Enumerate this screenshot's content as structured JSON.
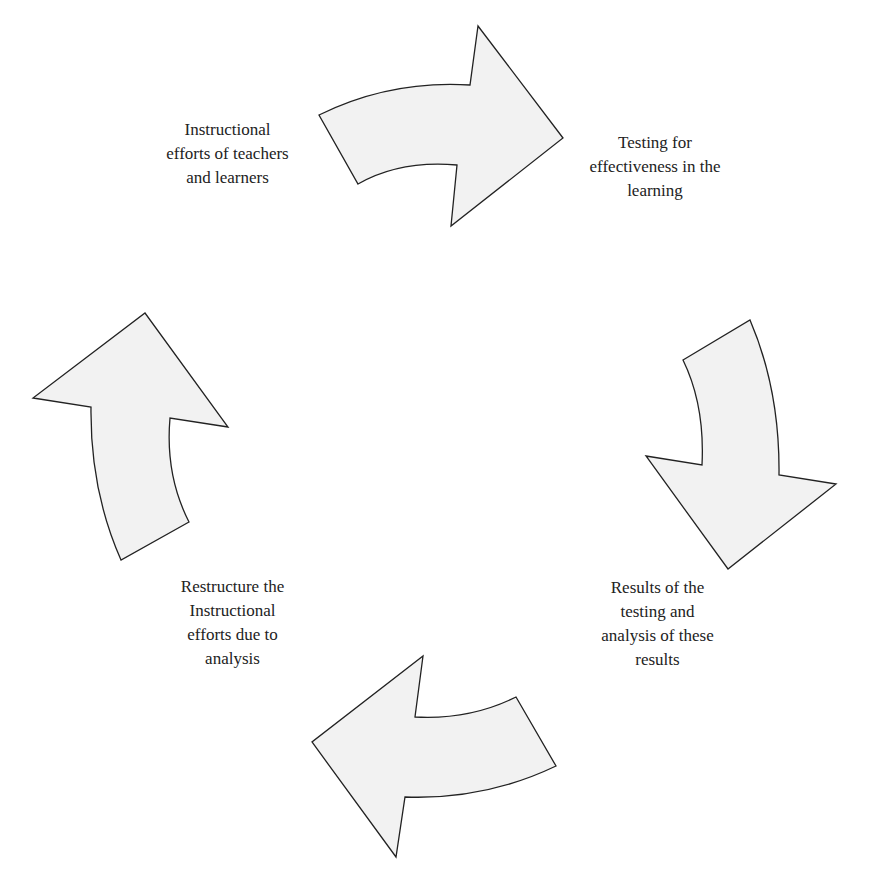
{
  "diagram": {
    "type": "cycle",
    "colors": {
      "arrow_fill": "#f2f2f2",
      "arrow_stroke": "#222222",
      "text": "#222222"
    },
    "steps": [
      {
        "id": "instruct",
        "label": "Instructional\nefforts of teachers\nand learners"
      },
      {
        "id": "testing",
        "label": "Testing for\neffectiveness in the\nlearning"
      },
      {
        "id": "results",
        "label": "Results of the\ntesting  and\nanalysis of  these\nresults"
      },
      {
        "id": "restructure",
        "label": "Restructure the\nInstructional\nefforts due to\nanalysis"
      }
    ],
    "arrows": [
      {
        "from": "instruct",
        "to": "testing",
        "direction": "right"
      },
      {
        "from": "testing",
        "to": "results",
        "direction": "down"
      },
      {
        "from": "results",
        "to": "restructure",
        "direction": "left"
      },
      {
        "from": "restructure",
        "to": "instruct",
        "direction": "up"
      }
    ]
  }
}
